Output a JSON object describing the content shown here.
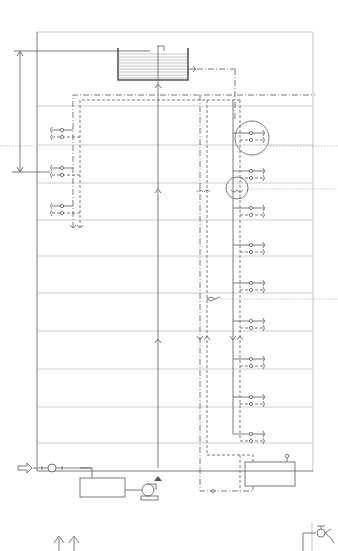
{
  "diagram": {
    "type": "plumbing-riser-schematic",
    "colors": {
      "line": "#6b6b6b",
      "floor_line": "#b8b8b8",
      "background": "#ffffff"
    },
    "building": {
      "frame": {
        "x": 37,
        "y": 32,
        "width": 276,
        "height": 439
      },
      "floor_levels_y": [
        106,
        145,
        183,
        220,
        256,
        293,
        331,
        369,
        407,
        443
      ]
    },
    "components": [
      {
        "id": "roof-tank",
        "name": "Elevated water tank",
        "symbol": "tank-with-water-hatching"
      },
      {
        "id": "pump",
        "name": "Circulation / supply pump",
        "symbol": "pump-on-base"
      },
      {
        "id": "storage-tank",
        "name": "Receiving tank (ground floor)",
        "symbol": "rectangle"
      },
      {
        "id": "water-heater",
        "name": "Water heater",
        "symbol": "rectangle-with-gauge"
      },
      {
        "id": "meter",
        "name": "Water meter at inlet",
        "symbol": "circle-inline"
      },
      {
        "id": "inlet-arrow",
        "name": "Mains water inlet",
        "symbol": "hollow-arrow"
      },
      {
        "id": "supply-riser",
        "name": "Main supply riser",
        "symbol": "solid-line-with-arrows"
      },
      {
        "id": "hot-riser-left",
        "name": "Left hot-water supply / return risers",
        "symbol": "dash-dot-lines"
      },
      {
        "id": "hot-riser-right",
        "name": "Right hot-water supply / return risers",
        "symbol": "solid-and-dashed-lines"
      },
      {
        "id": "detail-circle-1",
        "name": "Detail callout (branch connection)",
        "symbol": "circle"
      },
      {
        "id": "detail-circle-2",
        "name": "Detail callout (expansion joint)",
        "symbol": "circle"
      },
      {
        "id": "relief-valve",
        "name": "Valve on riser",
        "symbol": "valve"
      },
      {
        "id": "height-dimension",
        "name": "Tank height dimension",
        "symbol": "dimension-arrow"
      },
      {
        "id": "legend-arrows",
        "name": "Flow direction arrows (legend)",
        "symbol": "double-up-arrow"
      },
      {
        "id": "legend-valve",
        "name": "Faucet / valve symbol (legend)",
        "symbol": "faucet"
      }
    ],
    "left_branches_y": [
      129,
      136,
      168,
      175,
      205,
      212
    ],
    "right_branches_y": [
      134,
      141,
      170,
      177,
      209,
      216,
      246,
      253,
      284,
      291,
      322,
      329,
      360,
      367,
      397,
      404,
      434,
      441
    ]
  }
}
